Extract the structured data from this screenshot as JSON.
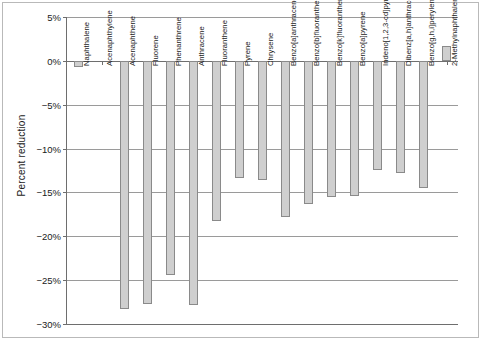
{
  "chart": {
    "ylabel": "Percent reduction",
    "xlabel": "",
    "title": ""
  },
  "axis": {
    "y_ticks": [
      "5%",
      "0%",
      "−5%",
      "−10%",
      "−15%",
      "−20%",
      "−25%",
      "−30%"
    ],
    "y_tick_values": [
      5,
      0,
      -5,
      -10,
      -15,
      -20,
      -25,
      -30
    ]
  },
  "colors": {
    "bar_fill": "#cfcfcf",
    "bar_edge": "#8a8a8a",
    "grid": "#9a9a9a",
    "axis": "#6e6e6e",
    "text": "#1a1a1a",
    "background": "#ffffff"
  },
  "chart_data": {
    "type": "bar",
    "title": "",
    "xlabel": "",
    "ylabel": "Percent reduction",
    "ylim": [
      -30,
      5
    ],
    "ytick_step": 5,
    "grid": true,
    "legend": "none",
    "categories": [
      "Naphthalene",
      "Acenaphthylene",
      "Acenaphthene",
      "Fluorene",
      "Phenanthrene",
      "Anthracene",
      "Fluoranthene",
      "Pyrene",
      "Chrysene",
      "Benzo[a]anthracene",
      "Benzo[b]fluoranthene",
      "Benzo[k]fluoranthene",
      "Benzo[a]pyrene",
      "Indeno[1,2,3-cd]pyrene",
      "Dibenz[a,h]anthracene",
      "Benzo[g,h,i]perylene",
      "2-Methylnaphthalene"
    ],
    "values": [
      -0.7,
      0.0,
      -28.3,
      -27.7,
      -24.4,
      -27.8,
      -18.3,
      -13.4,
      -13.6,
      -17.8,
      -16.3,
      -15.5,
      -15.4,
      -12.5,
      -12.8,
      -14.5,
      1.7
    ]
  }
}
